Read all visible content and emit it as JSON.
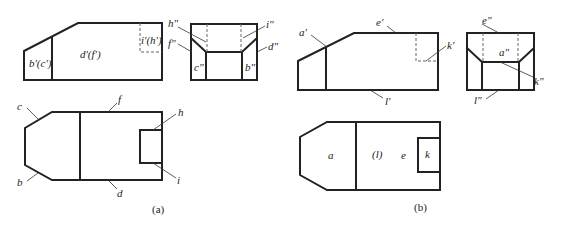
{
  "figure_a": {
    "caption": "(a)",
    "front_view": {
      "labels": {
        "b_c": "b'(c')",
        "d_f": "d'(f')",
        "i_h": "i'(h')"
      }
    },
    "profile_view": {
      "labels": {
        "h": "h\"",
        "i": "i\"",
        "f": "f\"",
        "d": "d\"",
        "c": "c\"",
        "b": "b\""
      }
    },
    "top_view": {
      "labels": {
        "c": "c",
        "f": "f",
        "h": "h",
        "b": "b",
        "i": "i",
        "d": "d"
      }
    }
  },
  "figure_b": {
    "caption": "(b)",
    "front_view": {
      "labels": {
        "a": "a'",
        "e": "e'",
        "k": "k'",
        "l": "l'"
      }
    },
    "profile_view": {
      "labels": {
        "e": "e\"",
        "a": "a\"",
        "k": "k\"",
        "l": "l\""
      }
    },
    "top_view": {
      "labels": {
        "a": "a",
        "l": "(l)",
        "e": "e",
        "k": "k"
      }
    }
  }
}
